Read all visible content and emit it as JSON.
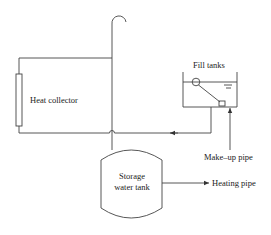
{
  "diagram": {
    "type": "solar heating system schematic",
    "labels": {
      "heat_collector": "Heat collector",
      "fill_tanks": "Fill tanks",
      "makeup_pipe": "Make–up pipe",
      "storage_tank_line1": "Storage",
      "storage_tank_line2": "water tank",
      "heating_pipe": "Heating pipe"
    },
    "colors": {
      "line": "#444444",
      "text": "#222222",
      "background": "#ffffff"
    },
    "components": [
      {
        "id": "heat-collector",
        "label": "Heat collector"
      },
      {
        "id": "expansion-pipe",
        "label": ""
      },
      {
        "id": "fill-tank",
        "label": "Fill tanks"
      },
      {
        "id": "storage-water-tank",
        "label": "Storage water tank"
      },
      {
        "id": "makeup-pipe",
        "label": "Make–up pipe"
      },
      {
        "id": "heating-pipe",
        "label": "Heating pipe"
      }
    ]
  }
}
